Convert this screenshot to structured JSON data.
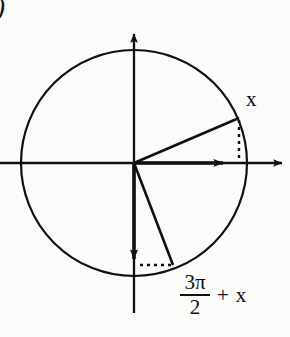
{
  "figure": {
    "kind": "unit-circle-diagram",
    "item_marker": ")",
    "width": 290,
    "height": 337,
    "background_color": "#fbfbfa",
    "ink_color": "#111111"
  },
  "circle": {
    "center_x": 134,
    "center_y": 163,
    "radius": 113,
    "stroke_width": 2.2,
    "stroke_color": "#111111"
  },
  "axes": {
    "x_axis": {
      "name": "horizontal-axis",
      "x1": 0,
      "y1": 163,
      "x2": 288,
      "y2": 163,
      "arrow_at_end": true
    },
    "y_axis": {
      "name": "vertical-axis",
      "x1": 134,
      "y1": 313,
      "x2": 134,
      "y2": 28,
      "arrow_at_end": true
    }
  },
  "vectors": [
    {
      "name": "terminal-ray-x",
      "label": "x",
      "from_x": 134,
      "from_y": 163,
      "to_x": 239,
      "to_y": 118,
      "arrow": false,
      "angle_degrees": 23
    },
    {
      "name": "reference-vector-horizontal",
      "label": "",
      "from_x": 134,
      "from_y": 163,
      "to_x": 232,
      "to_y": 163,
      "arrow": true,
      "angle_degrees": 0
    },
    {
      "name": "reference-vector-vertical-down",
      "label": "",
      "from_x": 134,
      "from_y": 163,
      "to_x": 134,
      "to_y": 268,
      "arrow": true,
      "angle_degrees": 270
    },
    {
      "name": "terminal-ray-three-pi-over-two-plus-x",
      "label": "3π/2 + x",
      "from_x": 134,
      "from_y": 163,
      "to_x": 173,
      "to_y": 265,
      "arrow": false,
      "angle_degrees": 291
    }
  ],
  "dashed_guides": [
    {
      "name": "vertical-dashed-guide",
      "x1": 239,
      "y1": 120,
      "x2": 239,
      "y2": 162,
      "dash": "3,4"
    },
    {
      "name": "horizontal-dashed-guide",
      "x1": 140,
      "y1": 265,
      "x2": 172,
      "y2": 265,
      "dash": "3,4"
    }
  ],
  "labels": {
    "x_label": "x",
    "angle_label": {
      "numerator": "3π",
      "denominator": "2",
      "operator": "+",
      "operand": "x",
      "full_text": "3π/2 + x"
    }
  }
}
